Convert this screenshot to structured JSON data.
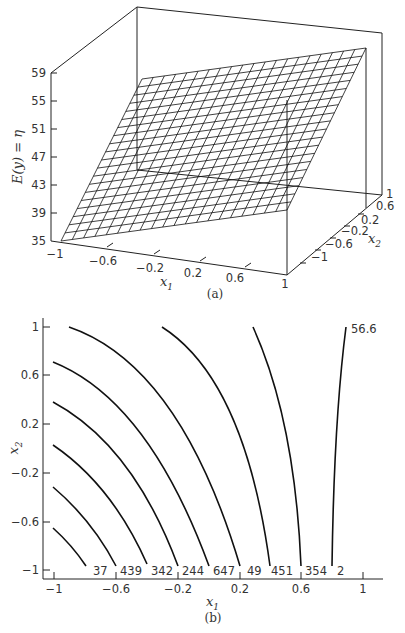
{
  "chart_data": [
    {
      "panel": "(a)",
      "type": "surface3d",
      "title": "",
      "zlabel": "E(y) = η",
      "xlabel": "x1",
      "ylabel": "x2",
      "z_ticks": [
        "35",
        "39",
        "43",
        "47",
        "51",
        "55",
        "59"
      ],
      "x1_ticks": [
        "-1",
        "-0.6",
        "-0.2",
        "0.2",
        "0.6",
        "1"
      ],
      "x2_ticks": [
        "-1",
        "-0.6",
        "-0.2",
        "0.2",
        "0.6",
        "1"
      ],
      "zlim": [
        35,
        59
      ],
      "xlim": [
        -1,
        1
      ],
      "ylim": [
        -1,
        1
      ],
      "description": "Wireframe planar-like response surface rising from ~35 at (x1=-1,x2=-1) to ~59 at (x1=1,x2=1)"
    },
    {
      "panel": "(b)",
      "type": "contour",
      "xlabel": "x1",
      "ylabel": "x2",
      "x_ticks": [
        "-1",
        "-0.6",
        "-0.2",
        "0.2",
        "0.6",
        "1"
      ],
      "y_ticks": [
        "-1",
        "-0.6",
        "-0.2",
        "0.2",
        "0.6",
        "1"
      ],
      "xlim": [
        -1,
        1
      ],
      "ylim": [
        -1,
        1
      ],
      "contour_labels": [
        "37",
        "439",
        "342",
        "244",
        "647",
        "49",
        "451",
        "354",
        "2"
      ],
      "top_label": "56.6"
    }
  ],
  "labels": {
    "z_axis_title": "E(y) = η",
    "x1_name": "x",
    "x1_sub": "1",
    "x2_name": "x",
    "x2_sub": "2",
    "panel_a": "(a)",
    "panel_b": "(b)",
    "top_contour": "56.6",
    "z_ticks": [
      "59",
      "55",
      "51",
      "47",
      "43",
      "39",
      "35"
    ],
    "x1_ticks_a": [
      "−1",
      "−0.6",
      "−0.2",
      "0.2",
      "0.6",
      "1"
    ],
    "x2_ticks_a": [
      "1",
      "0.6",
      "0.2",
      "−0.2",
      "−0.6",
      "−1"
    ],
    "x_ticks_b": [
      "−1",
      "−0.6",
      "−0.2",
      "0.2",
      "0.6",
      "1"
    ],
    "y_ticks_b": [
      "1",
      "0.6",
      "0.2",
      "−0.2",
      "−0.6",
      "−1"
    ],
    "contour_labels": [
      "37",
      "439",
      "342",
      "244",
      "647",
      "49",
      "451",
      "354",
      "2"
    ]
  }
}
